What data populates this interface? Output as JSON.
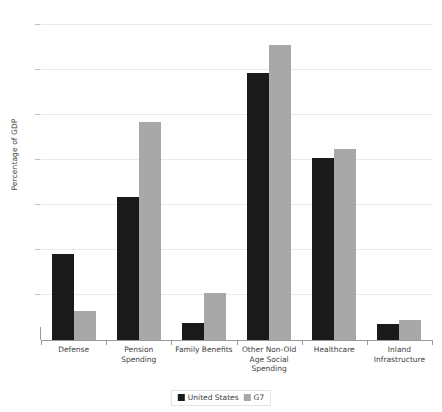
{
  "chart_data": {
    "type": "bar",
    "title": "",
    "xlabel": "",
    "ylabel": "Percentage of GDP",
    "ylim": [
      0,
      14
    ],
    "yticks": [
      0,
      2,
      4,
      6,
      8,
      10,
      12,
      14
    ],
    "ytick_labels": [
      "0",
      "2",
      "4",
      "6",
      "8",
      "10",
      "12",
      "14"
    ],
    "grid": true,
    "legend_position": "bottom-center",
    "categories": [
      "Defense",
      "Pension Spending",
      "Family Benefits",
      "Other Non-Old\nAge Social\nSpending",
      "Healthcare",
      "Inland\nInfrastructure"
    ],
    "series": [
      {
        "name": "United States",
        "color": "#1a1a1a",
        "values": [
          3.8,
          6.35,
          0.75,
          11.85,
          8.05,
          0.7
        ]
      },
      {
        "name": "G7",
        "color": "#a8a8a8",
        "values": [
          1.3,
          9.65,
          2.1,
          13.05,
          8.45,
          0.9
        ]
      }
    ]
  },
  "colors": {
    "united_states": "#1a1a1a",
    "g7": "#a8a8a8",
    "gridline": "#e9e9e9",
    "axis": "#9a9a9a",
    "text": "#3d3d3d",
    "background": "#ffffff"
  }
}
